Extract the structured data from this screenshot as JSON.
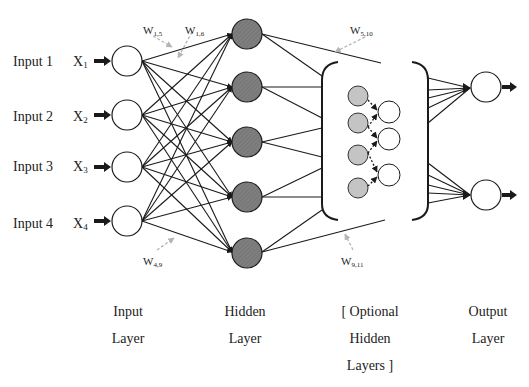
{
  "diagram": {
    "colors": {
      "line": "#1a1a1a",
      "hidden_fill": "#7f7f7f",
      "optional_fill": "#c4c4c4",
      "node_fill": "#ffffff",
      "weight_arrow": "#b5b5b5"
    },
    "inputs": [
      {
        "label": "Input 1",
        "var": "X",
        "sub": "1"
      },
      {
        "label": "Input 2",
        "var": "X",
        "sub": "2"
      },
      {
        "label": "Input 3",
        "var": "X",
        "sub": "3"
      },
      {
        "label": "Input 4",
        "var": "X",
        "sub": "4"
      }
    ],
    "weights": [
      {
        "var": "W",
        "sub": "1,5"
      },
      {
        "var": "W",
        "sub": "1,6"
      },
      {
        "var": "W",
        "sub": "5,10"
      },
      {
        "var": "W",
        "sub": "4,9"
      },
      {
        "var": "W",
        "sub": "9,11"
      }
    ],
    "layers": {
      "input": {
        "line1": "Input",
        "line2": "Layer"
      },
      "hidden": {
        "line1": "Hidden",
        "line2": "Layer"
      },
      "optional": {
        "line1": "[ Optional",
        "line2": "Hidden",
        "line3": "Layers ]"
      },
      "output": {
        "line1": "Output",
        "line2": "Layer"
      }
    },
    "node_counts": {
      "input": 4,
      "hidden": 5,
      "optional_inner_gray": 4,
      "optional_inner_white": 3,
      "output": 2
    }
  }
}
